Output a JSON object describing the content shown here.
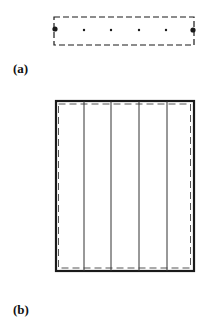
{
  "panels": [
    {
      "id": "a",
      "label": "(a)",
      "description": "Dashed rectangle with six nodes in a row; end nodes large",
      "dashed_rect": {
        "x": 54,
        "y": 17,
        "w": 140,
        "h": 28
      },
      "nodes": [
        {
          "x": 55,
          "y": 29,
          "r": 2.6,
          "size": "large"
        },
        {
          "x": 84,
          "y": 30,
          "r": 1.2,
          "size": "small"
        },
        {
          "x": 111,
          "y": 30,
          "r": 1.2,
          "size": "small"
        },
        {
          "x": 139,
          "y": 30,
          "r": 1.2,
          "size": "small"
        },
        {
          "x": 166,
          "y": 30,
          "r": 1.2,
          "size": "small"
        },
        {
          "x": 193,
          "y": 30,
          "r": 2.6,
          "size": "large"
        }
      ]
    },
    {
      "id": "b",
      "label": "(b)",
      "description": "Thick solid rectangle with inner dashed rectangle and four vertical strip lines",
      "outer_rect": {
        "x": 56,
        "y": 101,
        "w": 138,
        "h": 170
      },
      "dashed_rect": {
        "x": 58.5,
        "y": 104,
        "w": 132,
        "h": 164
      },
      "vertical_lines_x": [
        84,
        111,
        139,
        167
      ]
    }
  ],
  "colors": {
    "stroke": "#1a1a1a",
    "background": "#ffffff"
  }
}
